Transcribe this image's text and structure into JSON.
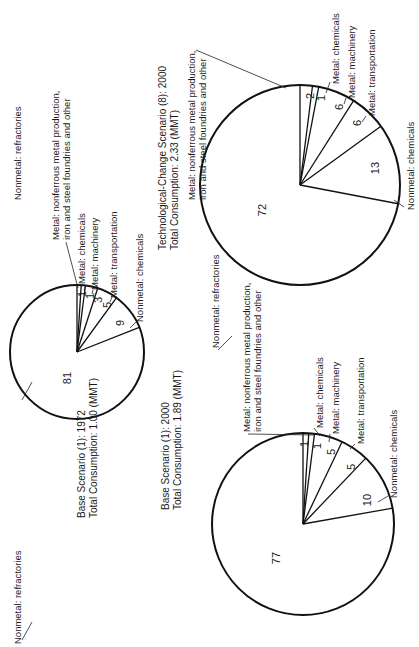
{
  "chart_data": [
    {
      "type": "pie",
      "title": "Base Scenario (1): 1972",
      "subtitle": "Total Consumption: 1.00 (MMT)",
      "categories": [
        "Metal: nonferrous metal production, iron and steel foundries and other",
        "Metal: chemicals",
        "Metal: machinery",
        "Metal: transportation",
        "Nonmetal: chemicals",
        "Nonmetal: refractories"
      ],
      "values": [
        1,
        1,
        3,
        5,
        9,
        81
      ],
      "units": "percent"
    },
    {
      "type": "pie",
      "title": "Base Scenario (1): 2000",
      "subtitle": "Total Consumption: 1.89 (MMT)",
      "categories": [
        "Metal: nonferrous metal production, iron and steel foundries and other",
        "Metal: chemicals",
        "Metal: machinery",
        "Metal: transportation",
        "Nonmetal: chemicals",
        "Nonmetal: refractories"
      ],
      "values": [
        1,
        1,
        5,
        5,
        10,
        77
      ],
      "units": "percent"
    },
    {
      "type": "pie",
      "title": "Technological-Change Scenario (8): 2000",
      "subtitle": "Total Consumption: 2.33 (MMT)",
      "categories": [
        "Metal: nonferrous metal production, iron and steel foundries and other",
        "Metal: chemicals",
        "Metal: machinery",
        "Metal: transportation",
        "Nonmetal: chemicals",
        "Nonmetal: refractories"
      ],
      "values": [
        2,
        1,
        6,
        6,
        13,
        72
      ],
      "units": "percent"
    }
  ],
  "pies": [
    {
      "cx": 77,
      "cy": 352,
      "r": 67,
      "values": [
        1,
        1,
        3,
        5,
        9,
        81
      ]
    },
    {
      "cx": 303,
      "cy": 524,
      "r": 91,
      "values": [
        1,
        1,
        5,
        5,
        10,
        77
      ]
    },
    {
      "cx": 300,
      "cy": 185,
      "r": 100,
      "values": [
        2,
        1,
        6,
        6,
        13,
        72
      ]
    }
  ],
  "labels": {
    "nonferrous_line1": "Metal: nonferrous metal production,",
    "nonferrous_line2": "iron and steel foundries and other",
    "metal_chemicals": "Metal: chemicals",
    "metal_machinery": "Metal: machinery",
    "metal_transportation": "Metal: transportation",
    "nonmetal_chemicals": "Nonmetal: chemicals",
    "nonmetal_refractories": "Nonmetal: refractories"
  },
  "titles": {
    "base1972": {
      "line1": "Base Scenario (1): 1972",
      "line2": "Total Consumption: 1.00 (MMT)"
    },
    "base2000": {
      "line1": "Base Scenario (1): 2000",
      "line2": "Total Consumption: 1.89 (MMT)"
    },
    "tech2000": {
      "line1": "Technological-Change Scenario (8): 2000",
      "line2": "Total Consumption: 2.33 (MMT)"
    }
  },
  "numbers": {
    "p1972": [
      "1",
      "1",
      "3",
      "5",
      "9",
      "81"
    ],
    "p2000": [
      "1",
      "1",
      "5",
      "5",
      "10",
      "77"
    ],
    "tech": [
      "2",
      "1",
      "6",
      "6",
      "13",
      "72"
    ]
  }
}
